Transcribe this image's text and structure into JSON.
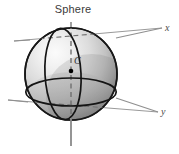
{
  "figure": {
    "title": "Sphere",
    "center_label": "C",
    "axis_labels": {
      "x": "x",
      "y": "y"
    },
    "colors": {
      "background": "#ffffff",
      "outline": "#1a1a1a",
      "axis": "#8a8a8a",
      "sphere_highlight": "#f2f2f2",
      "sphere_midtone": "#c9c9c9",
      "sphere_shadow": "#6e6e6e",
      "title_text": "#3b3b3b",
      "center_dot": "#000000"
    },
    "geometry": {
      "sphere_center_x": 71,
      "sphere_center_y": 74,
      "sphere_radius": 46,
      "equator_ry": 14,
      "meridian_rx": 17,
      "z_axis_top_y": 22,
      "z_axis_bottom_y": 146,
      "x_axis_end_x": 162,
      "x_axis_end_y": 28,
      "y_axis_end_x": 158,
      "y_axis_end_y": 112
    },
    "elements": {
      "sphere_body": "sphere",
      "equator": "equator-ellipse",
      "meridian": "meridian-ellipse",
      "z_axis": "vertical-axis",
      "x_axis": "x-axis",
      "y_axis": "y-axis",
      "center_point": "center-dot"
    }
  }
}
